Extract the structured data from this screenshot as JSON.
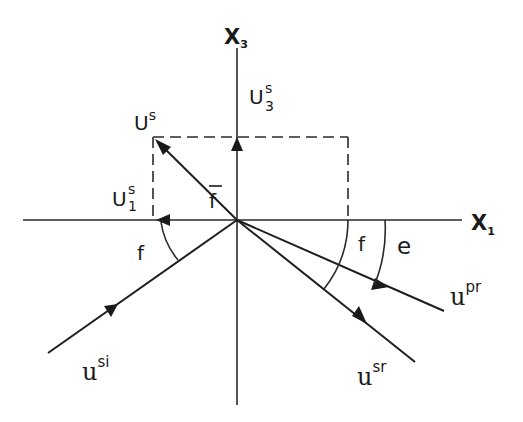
{
  "diagram": {
    "axes": {
      "horizontal": {
        "label": "X",
        "subscript": "1"
      },
      "vertical": {
        "label": "X",
        "subscript": "3"
      }
    },
    "vectors": {
      "displacement": {
        "label": "U",
        "superscript": "s"
      },
      "component_3": {
        "label": "U",
        "superscript": "s",
        "subscript": "3"
      },
      "component_1": {
        "label": "U",
        "superscript": "s",
        "subscript": "1"
      },
      "incident_sv": {
        "label": "u",
        "superscript": "si"
      },
      "reflected_p": {
        "label": "u",
        "superscript": "pr"
      },
      "reflected_sv": {
        "label": "u",
        "superscript": "sr"
      }
    },
    "angles": {
      "f_bar": "f",
      "f_incident": "f",
      "f_reflected": "f",
      "e_reflected_p": "e"
    }
  }
}
